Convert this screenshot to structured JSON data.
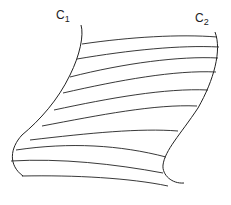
{
  "labels": {
    "c1": {
      "base": "C",
      "sub": "1"
    },
    "c2": {
      "base": "C",
      "sub": "2"
    }
  },
  "colors": {
    "stroke": "#222222",
    "background": "#ffffff"
  },
  "curves": {
    "c1": "M81,25 C84,35 80,55 70,75 C58,100 40,120 22,135 C10,148 8,165 23,176",
    "c2": "M215,32 C222,50 214,80 198,108 C180,135 165,150 163,165 C162,175 172,184 184,183"
  },
  "rulings": [
    "M82,44 C130,37 180,34 217,37",
    "M77,59 C130,50 180,45 219,47",
    "M70,77 C125,63 180,56 218,58",
    "M63,93 C120,80 175,70 216,72",
    "M54,110 C110,98 165,88 208,90",
    "M42,126 C100,115 155,104 197,106",
    "M30,140 C90,133 140,128 178,131",
    "M16,150 C70,142 120,145 166,157",
    "M11,161 C60,158 115,164 163,173",
    "M22,176 C75,175 130,178 168,186"
  ]
}
